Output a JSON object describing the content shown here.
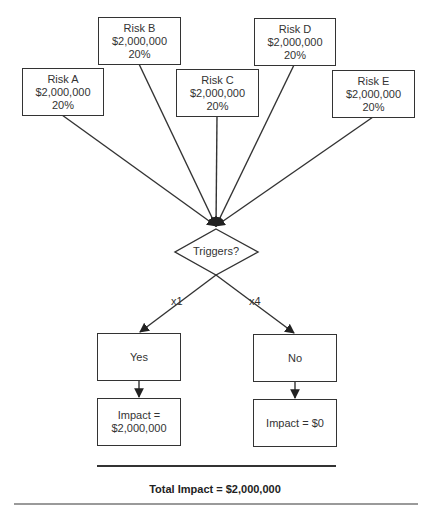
{
  "risks": [
    {
      "name": "Risk A",
      "amount": "$2,000,000",
      "probability": "20%"
    },
    {
      "name": "Risk B",
      "amount": "$2,000,000",
      "probability": "20%"
    },
    {
      "name": "Risk C",
      "amount": "$2,000,000",
      "probability": "20%"
    },
    {
      "name": "Risk D",
      "amount": "$2,000,000",
      "probability": "20%"
    },
    {
      "name": "Risk E",
      "amount": "$2,000,000",
      "probability": "20%"
    }
  ],
  "decision": {
    "label": "Triggers?"
  },
  "branches": [
    {
      "multiplier": "x1",
      "outcome": "Yes",
      "impact_line1": "Impact =",
      "impact_line2": "$2,000,000"
    },
    {
      "multiplier": "x4",
      "outcome": "No",
      "impact_line1": "Impact = $0",
      "impact_line2": ""
    }
  ],
  "total": {
    "label": "Total Impact = $2,000,000"
  },
  "colors": {
    "stroke": "#333333",
    "text": "#333333",
    "rule": "#9a9a9a"
  }
}
